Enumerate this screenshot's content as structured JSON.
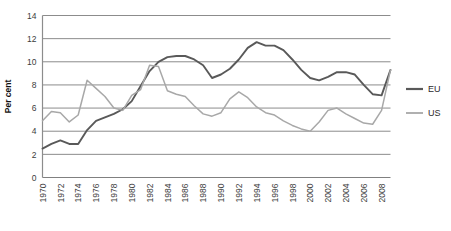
{
  "chart_data": {
    "type": "line",
    "title": "",
    "subtitle": "",
    "xlabel": "",
    "ylabel": "Per cent",
    "ylim": [
      0,
      14
    ],
    "ytick_step": 2,
    "yticks": [
      "0",
      "2",
      "4",
      "6",
      "8",
      "10",
      "12",
      "14"
    ],
    "grid": true,
    "grid_axis": "y",
    "legend_position": "right",
    "x": [
      1970,
      1971,
      1972,
      1973,
      1974,
      1975,
      1976,
      1977,
      1978,
      1979,
      1980,
      1981,
      1982,
      1983,
      1984,
      1985,
      1986,
      1987,
      1988,
      1989,
      1990,
      1991,
      1992,
      1993,
      1994,
      1995,
      1996,
      1997,
      1998,
      1999,
      2000,
      2001,
      2002,
      2003,
      2004,
      2005,
      2006,
      2007,
      2008,
      2009
    ],
    "xtick_labels": [
      "1970",
      "1972",
      "1974",
      "1976",
      "1978",
      "1980",
      "1982",
      "1984",
      "1986",
      "1988",
      "1990",
      "1992",
      "1994",
      "1996",
      "1998",
      "2000",
      "2002",
      "2004",
      "2006",
      "2008"
    ],
    "xtick_values": [
      1970,
      1972,
      1974,
      1976,
      1978,
      1980,
      1982,
      1984,
      1986,
      1988,
      1990,
      1992,
      1994,
      1996,
      1998,
      2000,
      2002,
      2004,
      2006,
      2008
    ],
    "series": [
      {
        "name": "EU",
        "color": "#595959",
        "values": [
          2.5,
          2.9,
          3.2,
          2.9,
          2.9,
          4.1,
          4.9,
          5.2,
          5.5,
          5.9,
          6.6,
          7.9,
          9.2,
          10.0,
          10.4,
          10.5,
          10.5,
          10.2,
          9.7,
          8.6,
          8.9,
          9.4,
          10.2,
          11.2,
          11.7,
          11.4,
          11.4,
          11.0,
          10.2,
          9.3,
          8.6,
          8.4,
          8.7,
          9.1,
          9.1,
          8.9,
          8.0,
          7.2,
          7.1,
          9.3
        ]
      },
      {
        "name": "US",
        "color": "#a8a8a8",
        "values": [
          4.9,
          5.7,
          5.6,
          4.8,
          5.4,
          8.4,
          7.7,
          7.0,
          6.0,
          5.8,
          7.1,
          7.6,
          9.7,
          9.6,
          7.5,
          7.2,
          7.0,
          6.2,
          5.5,
          5.3,
          5.6,
          6.8,
          7.4,
          6.9,
          6.1,
          5.6,
          5.4,
          4.9,
          4.5,
          4.2,
          4.0,
          4.8,
          5.8,
          6.0,
          5.5,
          5.1,
          4.7,
          4.6,
          5.8,
          9.3
        ]
      }
    ],
    "legend": [
      {
        "label": "EU",
        "color": "#595959"
      },
      {
        "label": "US",
        "color": "#a8a8a8"
      }
    ]
  }
}
